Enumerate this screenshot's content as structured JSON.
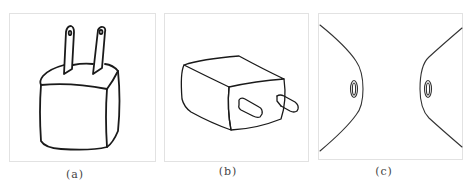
{
  "figure": {
    "panels": [
      {
        "id": "a",
        "label": "(a)",
        "subject": "upright-plug-adapter-two-prongs"
      },
      {
        "id": "b",
        "label": "(b)",
        "subject": "charger-isometric-view-flat-prongs"
      },
      {
        "id": "c",
        "label": "(c)",
        "subject": "curved-profile-with-oval-holes"
      }
    ],
    "colors": {
      "stroke": "#222222",
      "border": "#e2e2e2",
      "background": "#ffffff"
    }
  }
}
